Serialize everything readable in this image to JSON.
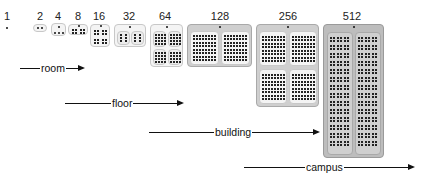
{
  "diagram": {
    "type": "hierarchical-scale",
    "levels": [
      {
        "count": "1"
      },
      {
        "count": "2"
      },
      {
        "count": "4"
      },
      {
        "count": "8"
      },
      {
        "count": "16"
      },
      {
        "count": "32"
      },
      {
        "count": "64"
      },
      {
        "count": "128"
      },
      {
        "count": "256"
      },
      {
        "count": "512"
      }
    ],
    "scales": [
      {
        "label": "room"
      },
      {
        "label": "floor"
      },
      {
        "label": "building"
      },
      {
        "label": "campus"
      }
    ],
    "colors": {
      "light_box": "#f4f4f4",
      "mid_box": "#cfcfcf",
      "dark_box": "#bdbdbd",
      "ink": "#111111"
    }
  }
}
